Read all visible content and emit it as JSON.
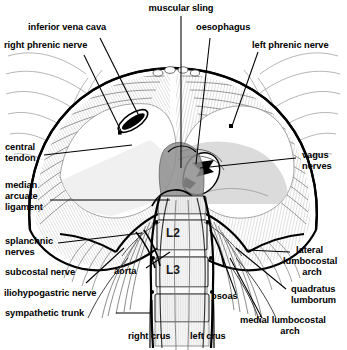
{
  "figure": {
    "width": 347,
    "height": 350,
    "background": "#ffffff",
    "ink": "#000000"
  },
  "labels": {
    "inferior_vena_cava": "inferior vena cava",
    "right_phrenic_nerve": "right phrenic nerve",
    "muscular_sling": "muscular sling",
    "oesophagus": "oesophagus",
    "left_phrenic_nerve": "left phrenic nerve",
    "central_tendon_l1": "central",
    "central_tendon_l2": "tendon",
    "median_arcuate_l1": "median",
    "median_arcuate_l2": "arcuate",
    "median_arcuate_l3": "ligament",
    "splanchnic_l1": "splanchnic",
    "splanchnic_l2": "nerves",
    "subcostal_nerve": "subcostal nerve",
    "iliohypogastric_nerve": "iliohypogastric nerve",
    "sympathetic_trunk": "sympathetic trunk",
    "aorta": "aorta",
    "vagus_l1": "vagus",
    "vagus_l2": "nerves",
    "lateral_arch_l1": "lateral",
    "lateral_arch_l2": "lumbocostal",
    "lateral_arch_l3": "arch",
    "quadratus_l1": "quadratus",
    "quadratus_l2": "lumborum",
    "psoas": "psoas",
    "medial_arch_l1": "medial lumbocostal",
    "medial_arch_l2": "arch",
    "right_crus": "right crus",
    "left_crus": "left crus",
    "vertebra_l2": "L2",
    "vertebra_l3": "L3"
  },
  "colors": {
    "line": "#000000",
    "hatch": "#4a4a4a",
    "faint": "#9a9a9a",
    "bone_fill": "#f2f2f2",
    "shadow_fill": "#8c8c8c",
    "tendon_fill": "#ffffff"
  }
}
